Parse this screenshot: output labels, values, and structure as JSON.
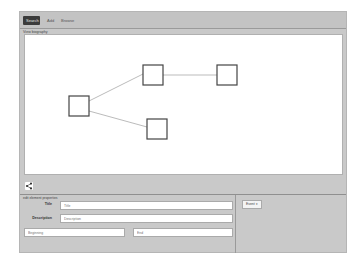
{
  "tabs": [
    {
      "label": "Search",
      "active": true
    },
    {
      "label": "Add",
      "active": false
    },
    {
      "label": "Browse",
      "active": false
    }
  ],
  "diagram": {
    "section_label": "View biography",
    "nodes": [
      {
        "id": "n1",
        "x": 44,
        "y": 61,
        "size": 20
      },
      {
        "id": "n2",
        "x": 118,
        "y": 30,
        "size": 20
      },
      {
        "id": "n3",
        "x": 192,
        "y": 30,
        "size": 20
      },
      {
        "id": "n4",
        "x": 122,
        "y": 84,
        "size": 20
      }
    ],
    "edges": [
      {
        "from": "n1",
        "to": "n2"
      },
      {
        "from": "n2",
        "to": "n3"
      },
      {
        "from": "n1",
        "to": "n4"
      }
    ],
    "share_icon": "share-icon"
  },
  "properties": {
    "title": "edit element properties",
    "title_label": "Title",
    "title_placeholder": "Title",
    "description_label": "Description",
    "description_placeholder": "Description",
    "beginning_placeholder": "Beginning",
    "end_placeholder": "End"
  },
  "side": {
    "event_button": "Event ▾"
  },
  "colors": {
    "active_tab": "#3b3b3b",
    "frame": "#c9c9c9",
    "canvas": "#ffffff",
    "node_stroke": "#444444",
    "edge": "#aaaaaa"
  }
}
